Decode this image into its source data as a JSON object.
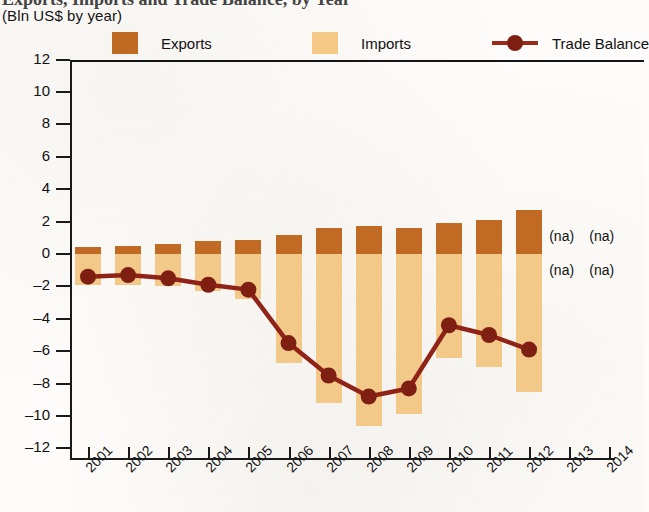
{
  "header": {
    "title": "Exports, Imports and Trade Balance, by Year",
    "subtitle": "(Bln US$ by year)"
  },
  "legend": {
    "exports": {
      "label": "Exports",
      "color": "#c06a23",
      "swatch_icon": "square-swatch-icon"
    },
    "imports": {
      "label": "Imports",
      "color": "#f3c989",
      "swatch_icon": "square-swatch-icon"
    },
    "balance": {
      "label": "Trade Balance",
      "color": "#8f2318",
      "marker_icon": "line-marker-icon"
    }
  },
  "axes": {
    "y_ticks": [
      "12",
      "10",
      "8",
      "6",
      "4",
      "2",
      "0",
      "–2",
      "–4",
      "–6",
      "–8",
      "–10",
      "–12"
    ],
    "x_ticks": [
      "2001",
      "2002",
      "2003",
      "2004",
      "2005",
      "2006",
      "2007",
      "2008",
      "2009",
      "2010",
      "2011",
      "2012",
      "2013",
      "2014"
    ]
  },
  "annotations": {
    "na": "(na)",
    "na_cells": [
      {
        "year": "2013",
        "position": "above-zero"
      },
      {
        "year": "2014",
        "position": "above-zero"
      },
      {
        "year": "2013",
        "position": "below-zero"
      },
      {
        "year": "2014",
        "position": "below-zero"
      }
    ]
  },
  "chart_data": {
    "type": "bar",
    "title": "Exports, Imports and Trade Balance, by Year",
    "subtitle": "(Bln US$ by year)",
    "xlabel": "",
    "ylabel": "Bln US$",
    "ylim": [
      -12,
      12
    ],
    "ytick_step": 2,
    "grid": false,
    "legend_position": "top",
    "categories": [
      "2001",
      "2002",
      "2003",
      "2004",
      "2005",
      "2006",
      "2007",
      "2008",
      "2009",
      "2010",
      "2011",
      "2012",
      "2013",
      "2014"
    ],
    "series": [
      {
        "name": "Exports",
        "type": "bar",
        "color": "#c06a23",
        "values": [
          0.45,
          0.5,
          0.6,
          0.8,
          0.85,
          1.2,
          1.6,
          1.7,
          1.6,
          1.9,
          2.1,
          2.7,
          null,
          null
        ]
      },
      {
        "name": "Imports",
        "type": "bar",
        "color": "#f3c989",
        "values": [
          -1.9,
          -1.9,
          -2.0,
          -2.3,
          -2.8,
          -6.7,
          -9.2,
          -10.6,
          -9.9,
          -6.4,
          -7.0,
          -8.5,
          null,
          null
        ]
      },
      {
        "name": "Trade Balance",
        "type": "line",
        "color": "#8f2318",
        "values": [
          -1.4,
          -1.3,
          -1.5,
          -1.9,
          -2.2,
          -5.5,
          -7.5,
          -8.8,
          -8.3,
          -4.4,
          -5.0,
          -5.9,
          null,
          null
        ]
      }
    ]
  }
}
